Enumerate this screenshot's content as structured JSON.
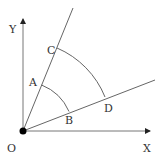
{
  "diagram": {
    "labels": {
      "y_axis": "Y",
      "x_axis": "X",
      "origin": "O",
      "A": "A",
      "B": "B",
      "C": "C",
      "D": "D"
    },
    "colors": {
      "line": "#555555",
      "point": "#000000",
      "text": "#333333"
    }
  }
}
